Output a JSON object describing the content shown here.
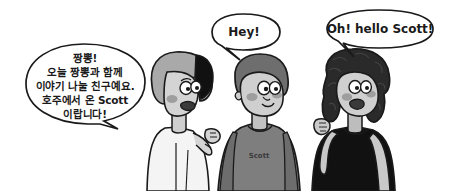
{
  "scene": {
    "width": 449,
    "height": 191,
    "background_color": "#ffffff",
    "title": "Three cartoon characters introducing Scott",
    "style": "hand-drawn black-outline cartoon illustration, grayscale"
  },
  "speech_bubbles": [
    {
      "id": "bubble-korean",
      "speaker": "left-character",
      "language": "ko",
      "lines": [
        "짱뽕!",
        "오늘 짱뽕과 함께",
        "이야기 나눌 친구예요.",
        "호주에서 온 Scott",
        "이랍니다!"
      ],
      "tail_direction": "right",
      "outline_color": "#1a1a1a",
      "fill_color": "#ffffff"
    },
    {
      "id": "bubble-hey",
      "speaker": "middle-character",
      "language": "en",
      "lines": [
        "Hey!"
      ],
      "tail_direction": "down",
      "outline_color": "#1a1a1a",
      "fill_color": "#ffffff"
    },
    {
      "id": "bubble-hello",
      "speaker": "right-character",
      "language": "en",
      "lines": [
        "Oh! hello Scott!"
      ],
      "tail_direction": "down-left",
      "outline_color": "#1a1a1a",
      "fill_color": "#ffffff"
    }
  ],
  "characters": [
    {
      "id": "left-character",
      "name": "woman-bob-haircut",
      "position": "left",
      "hair_color": "#a9a9a9",
      "hair_accent_color": "#111111",
      "skin_color": "#d4d4d4",
      "cheek_color": "#a0a0a0",
      "clothing_color": "#f2f2f2",
      "clothing_label": "",
      "pose": "raised right hand, pointing gesture"
    },
    {
      "id": "middle-character",
      "name": "scott",
      "position": "center",
      "hair_color": "#6e6e6e",
      "skin_color": "#cfcfcf",
      "cheek_color": "#9a9a9a",
      "clothing_color": "#7e7e7e",
      "clothing_label": "Scott",
      "pose": "standing, arms down"
    },
    {
      "id": "right-character",
      "name": "woman-curly-pigtails",
      "position": "right",
      "hair_color": "#2a2a2a",
      "skin_color": "#cfcfcf",
      "cheek_color": "#9a9a9a",
      "clothing_color": "#111111",
      "clothing_label": "",
      "pose": "raised left hand waving"
    }
  ],
  "colors": {
    "outline": "#1a1a1a",
    "background": "#ffffff",
    "skin": "#d0d0d0",
    "skin_shadow": "#b4b4b4",
    "hair_light": "#a9a9a9",
    "hair_mid": "#6e6e6e",
    "hair_dark": "#2a2a2a",
    "shirt_gray": "#7e7e7e",
    "shirt_black": "#111111",
    "shirt_white": "#f4f4f4",
    "cheek": "#9e9e9e",
    "eye_white": "#ffffff"
  }
}
